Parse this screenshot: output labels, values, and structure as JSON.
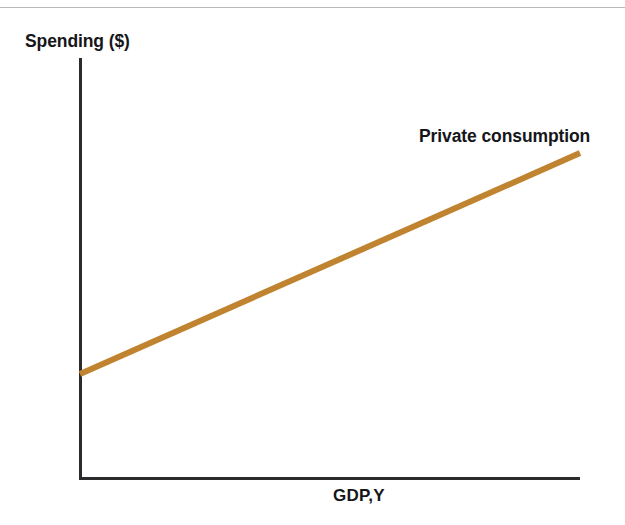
{
  "figure": {
    "background_color": "#ffffff",
    "width": 625,
    "height": 525,
    "top_rule_color": "#b9b9bc"
  },
  "axes": {
    "line_color": "#2b2b2e",
    "y_title": "Spending ($)",
    "x_title": "GDP,Y"
  },
  "series_label": "Private consumption",
  "chart_data": {
    "type": "line",
    "title": "",
    "subtitle": "",
    "xlabel": "GDP,Y",
    "ylabel": "Spending ($)",
    "grid": false,
    "legend_position": "inline-end-of-line",
    "axis_ticks": {
      "x": [],
      "y": []
    },
    "xlim": [
      0,
      100
    ],
    "ylim": [
      0,
      100
    ],
    "annotations": [
      {
        "text": "Private consumption",
        "x": 83,
        "y": 92,
        "anchor": "left"
      }
    ],
    "series": [
      {
        "name": "Private consumption",
        "color": "#c0832f",
        "line_width": 6,
        "x": [
          0,
          100
        ],
        "y": [
          24.6,
          77.3
        ],
        "description": "Upward sloping straight line with positive intercept; consumption rises less than one-for-one with GDP",
        "intercept": 24.6,
        "slope": 0.527
      }
    ]
  }
}
